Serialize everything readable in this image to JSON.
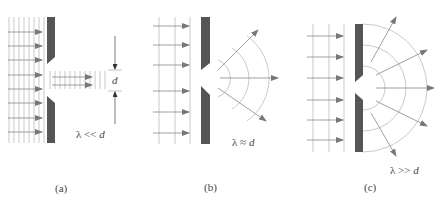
{
  "figure": {
    "colors": {
      "barrier": "#555555",
      "wavefront": "#b8b8b8",
      "ray": "#888888",
      "arrowhead": "#777777",
      "text": "#444444"
    },
    "panels": [
      {
        "id": "a",
        "caption": "(a)",
        "condition": "λ << d",
        "condition_lambda": "λ",
        "condition_op": " << ",
        "condition_var": "d",
        "dimension_label": "d",
        "description": "Wavelength much smaller than slit: wave passes straight through with little diffraction"
      },
      {
        "id": "b",
        "caption": "(b)",
        "condition": "λ ≈ d",
        "condition_lambda": "λ",
        "condition_op": " ≈ ",
        "condition_var": "d",
        "description": "Wavelength comparable to slit: wave spreads in limited arcs"
      },
      {
        "id": "c",
        "caption": "(c)",
        "condition": "λ >> d",
        "condition_lambda": "λ",
        "condition_op": " >> ",
        "condition_var": "d",
        "description": "Wavelength much larger than slit: slit acts as point source, semicircular wavefronts"
      }
    ]
  }
}
